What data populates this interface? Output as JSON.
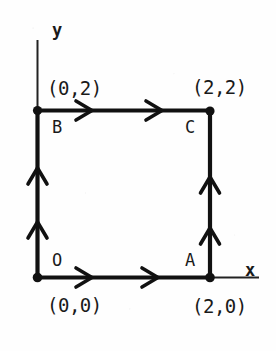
{
  "figure": {
    "kind": "square-path-diagram",
    "background_color": "#fefefe",
    "ink_color": "#111111",
    "axes": {
      "x_label": "x",
      "y_label": "y",
      "origin_px": {
        "x": 37,
        "y": 277
      }
    },
    "vertices": [
      {
        "id": "O",
        "name": "O",
        "coord_text": "(0,0)",
        "x": 0,
        "y": 0,
        "px": {
          "x": 37,
          "y": 277
        }
      },
      {
        "id": "A",
        "name": "A",
        "coord_text": "(2,0)",
        "x": 2,
        "y": 0,
        "px": {
          "x": 210,
          "y": 278
        }
      },
      {
        "id": "C",
        "name": "C",
        "coord_text": "(2,2)",
        "x": 2,
        "y": 2,
        "px": {
          "x": 210,
          "y": 111
        }
      },
      {
        "id": "B",
        "name": "B",
        "coord_text": "(0,2)",
        "x": 0,
        "y": 2,
        "px": {
          "x": 37,
          "y": 110
        }
      }
    ],
    "edges": [
      {
        "id": "edge-OA",
        "from": "O",
        "to": "A",
        "direction": "right",
        "arrowheads": 2
      },
      {
        "id": "edge-AC",
        "from": "A",
        "to": "C",
        "direction": "up",
        "arrowheads": 2
      },
      {
        "id": "edge-BC",
        "from": "B",
        "to": "C",
        "direction": "right",
        "arrowheads": 2
      },
      {
        "id": "edge-OB",
        "from": "O",
        "to": "B",
        "direction": "up",
        "arrowheads": 2
      }
    ],
    "labels": {
      "y_axis": "y",
      "x_axis": "x",
      "top_left_coord": "(0,2)",
      "top_right_coord": "(2,2)",
      "bottom_left_coord": "(0,0)",
      "bottom_right_coord": "(2,0)",
      "vertex_b": "B",
      "vertex_c": "C",
      "vertex_o": "O",
      "vertex_a": "A"
    }
  }
}
